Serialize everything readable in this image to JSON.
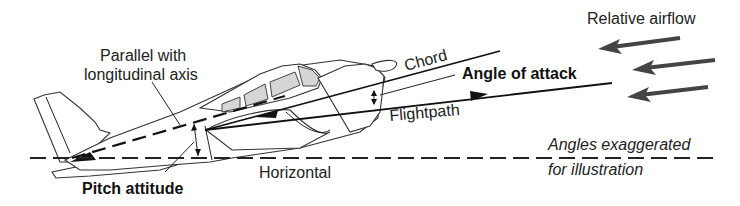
{
  "diagram": {
    "labels": {
      "parallel_line1": "Parallel with",
      "parallel_line2": "longitudinal axis",
      "chord": "Chord",
      "angle_of_attack": "Angle of attack",
      "flightpath": "Flightpath",
      "relative_airflow": "Relative airflow",
      "horizontal": "Horizontal",
      "pitch_attitude": "Pitch attitude",
      "note_line1": "Angles exaggerated",
      "note_line2": "for illustration"
    },
    "elements": [
      {
        "id": "horizontal-line",
        "style": "dashed",
        "orientation": "horizontal"
      },
      {
        "id": "longitudinal-axis-line",
        "style": "dashed",
        "note": "parallel with longitudinal axis"
      },
      {
        "id": "chord-line",
        "style": "solid"
      },
      {
        "id": "flightpath-line",
        "style": "solid",
        "arrowhead": "forward"
      },
      {
        "id": "relative-airflow-arrows",
        "count": 3,
        "direction": "right-to-left"
      },
      {
        "id": "pitch-attitude-angle-marker",
        "between": [
          "Horizontal",
          "Longitudinal axis"
        ]
      },
      {
        "id": "angle-of-attack-marker",
        "between": [
          "Chord",
          "Flightpath"
        ]
      }
    ],
    "colors": {
      "line": "#111111",
      "airflow_arrow": "#444444",
      "window_fill": "#d6d6d6",
      "background": "#ffffff"
    }
  }
}
